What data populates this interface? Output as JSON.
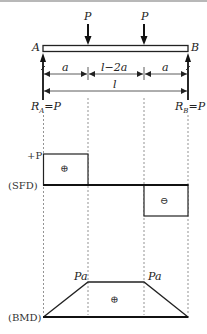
{
  "diagram": {
    "type": "beam-shear-moment",
    "loads": [
      {
        "label": "P",
        "position": "a"
      },
      {
        "label": "P",
        "position": "l-a"
      }
    ],
    "supports": {
      "left": {
        "label": "A",
        "reaction_name": "R",
        "reaction_sub": "A",
        "reaction_value": "=P"
      },
      "right": {
        "label": "B",
        "reaction_name": "R",
        "reaction_sub": "B",
        "reaction_value": "=P"
      }
    },
    "dimensions": {
      "segments": [
        "a",
        "l−2a",
        "a"
      ],
      "total": "l"
    },
    "sfd": {
      "label": "(SFD)",
      "max_label": "+P",
      "positive_sign": "⊕",
      "negative_sign": "⊖"
    },
    "bmd": {
      "label": "(BMD)",
      "peak_labels": [
        "Pa",
        "Pa"
      ],
      "sign": "⊕"
    }
  }
}
